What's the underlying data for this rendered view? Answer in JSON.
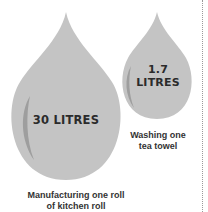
{
  "infographic": {
    "items": [
      {
        "value": "30 LITRES",
        "caption_line1": "Manufacturing one roll",
        "caption_line2": "of kitchen roll"
      },
      {
        "value_line1": "1.7",
        "value_line2": "LITRES",
        "caption_line1": "Washing one",
        "caption_line2": "tea towel"
      }
    ],
    "colors": {
      "drop_fill": "#c4c4c4",
      "drop_highlight": "#9e9e9e",
      "text": "#2b2b2b",
      "divider": "#9a9a9a"
    }
  }
}
